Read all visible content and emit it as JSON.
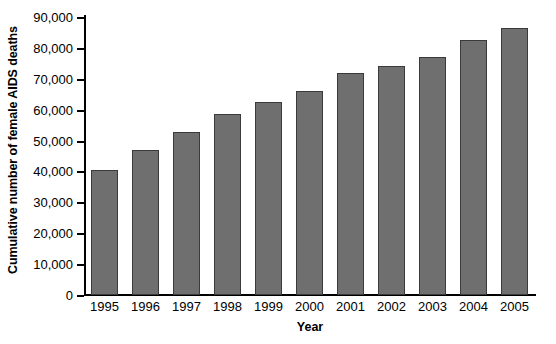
{
  "chart_data": {
    "type": "bar",
    "title": "",
    "xlabel": "Year",
    "ylabel": "Cumulative number of female AIDS deaths",
    "categories": [
      "1995",
      "1996",
      "1997",
      "1998",
      "1999",
      "2000",
      "2001",
      "2002",
      "2003",
      "2004",
      "2005"
    ],
    "values": [
      40400,
      47000,
      52800,
      58500,
      62600,
      66100,
      71900,
      74300,
      77200,
      82500,
      86400
    ],
    "ylim": [
      0,
      90000
    ],
    "ytick_values": [
      0,
      10000,
      20000,
      30000,
      40000,
      50000,
      60000,
      70000,
      80000,
      90000
    ],
    "ytick_labels": [
      "0",
      "10,000",
      "20,000",
      "30,000",
      "40,000",
      "50,000",
      "60,000",
      "70,000",
      "80,000",
      "90,000"
    ],
    "grid": false,
    "legend": "none",
    "bar_color": "#6f6f6f",
    "bar_edge_color": "#3a3a3a",
    "axis_color": "#000000",
    "background_color": "#ffffff"
  },
  "caption": {
    "sliver_text": ""
  }
}
